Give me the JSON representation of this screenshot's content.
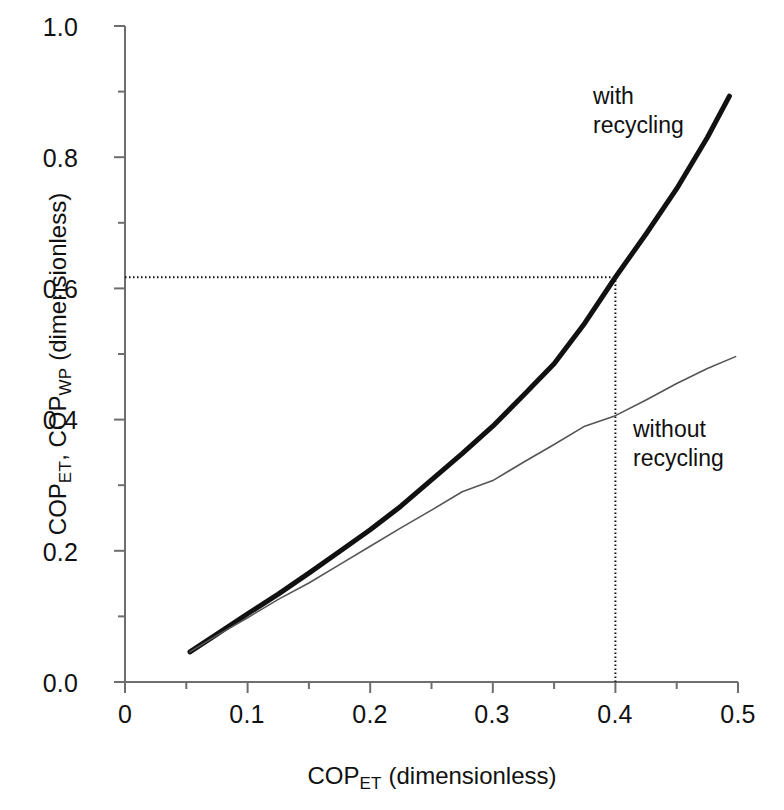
{
  "chart_data": {
    "type": "line",
    "title": "",
    "subtitle": "",
    "xlabel_text": "COP",
    "xlabel_sub": "ET",
    "xlabel_tail": " (dimensionless)",
    "ylabel_text_1": "COP",
    "ylabel_sub_1": "ET",
    "ylabel_mid": ", COP",
    "ylabel_sub_2": "WP",
    "ylabel_tail": " (dimensionless)",
    "xlabel": "COPET (dimensionless)",
    "ylabel": "COPET, COPWP (dimensionless)",
    "xlim": [
      0,
      0.5
    ],
    "ylim": [
      0.0,
      1.0
    ],
    "xticks": [
      "0",
      "0.1",
      "0.2",
      "0.3",
      "0.4",
      "0.5"
    ],
    "xtick_values": [
      0,
      0.1,
      0.2,
      0.3,
      0.4,
      0.5
    ],
    "yticks": [
      "0.0",
      "0.2",
      "0.4",
      "0.6",
      "0.8",
      "1.0"
    ],
    "ytick_values": [
      0.0,
      0.2,
      0.4,
      0.6,
      0.8,
      1.0
    ],
    "minor_ticks": true,
    "grid": false,
    "legend_position": "inline-annotations",
    "series": [
      {
        "name": "with recycling",
        "style": "thick-solid-black",
        "color": "#111111",
        "width": 5,
        "x": [
          0.053,
          0.075,
          0.1,
          0.125,
          0.15,
          0.175,
          0.2,
          0.225,
          0.25,
          0.275,
          0.3,
          0.325,
          0.35,
          0.375,
          0.4,
          0.425,
          0.45,
          0.475,
          0.493
        ],
        "values": [
          0.046,
          0.073,
          0.104,
          0.134,
          0.166,
          0.199,
          0.232,
          0.268,
          0.308,
          0.348,
          0.39,
          0.437,
          0.485,
          0.547,
          0.617,
          0.683,
          0.752,
          0.83,
          0.893
        ]
      },
      {
        "name": "without recycling",
        "style": "thin-solid-gray",
        "color": "#555555",
        "width": 1.6,
        "x": [
          0.053,
          0.075,
          0.1,
          0.125,
          0.15,
          0.175,
          0.2,
          0.225,
          0.25,
          0.275,
          0.3,
          0.325,
          0.35,
          0.375,
          0.4,
          0.425,
          0.45,
          0.475,
          0.498
        ],
        "values": [
          0.046,
          0.071,
          0.098,
          0.126,
          0.151,
          0.179,
          0.207,
          0.235,
          0.262,
          0.29,
          0.307,
          0.335,
          0.362,
          0.39,
          0.406,
          0.43,
          0.455,
          0.478,
          0.496
        ]
      }
    ],
    "annotations": [
      {
        "id": "with-recycling",
        "label": "with\nrecycling",
        "x": 0.44,
        "y": 0.93
      },
      {
        "id": "without-recycling",
        "label": "without\nrecycling",
        "x": 0.465,
        "y": 0.4
      }
    ],
    "reference_lines": [
      {
        "id": "vertical-ref",
        "orientation": "vertical",
        "value": 0.4,
        "style": "dotted",
        "color": "#111111"
      },
      {
        "id": "horizontal-ref",
        "orientation": "horizontal",
        "value": 0.617,
        "style": "dotted",
        "color": "#111111"
      }
    ],
    "axis_color": "#6e6e6e",
    "background": "#ffffff"
  }
}
